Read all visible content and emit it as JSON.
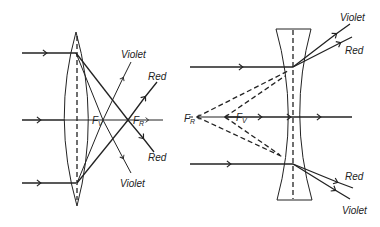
{
  "diagram": {
    "convex_lens": {
      "labels": {
        "violet_top": "Violet",
        "red_top": "Red",
        "red_bottom": "Red",
        "violet_bottom": "Violet",
        "focus_violet": "F",
        "focus_violet_sub": "V",
        "focus_red": "F",
        "focus_red_sub": "R"
      }
    },
    "concave_lens": {
      "labels": {
        "violet_top": "Violet",
        "red_top": "Red",
        "red_bottom": "Red",
        "violet_bottom": "Violet",
        "focus_violet": "F",
        "focus_violet_sub": "V",
        "focus_red": "F",
        "focus_red_sub": "R"
      }
    },
    "colors": {
      "line": "#222222",
      "background": "#ffffff"
    }
  }
}
